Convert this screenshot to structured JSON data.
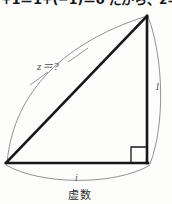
{
  "page": {
    "background_color": "#fdfdfc",
    "ink_color": "#17171a",
    "thin_line_color": "#7a7a80"
  },
  "top_text": {
    "clipped_line": "+1＝1+(−1)＝0 だから、z＝0 でも"
  },
  "diagram": {
    "hypotenuse_label": "z＝?",
    "vertical_side_label": "1",
    "base_side_label": "i",
    "base_caption": "虚数",
    "right_angle_marker": "right-angle-square",
    "vertices": {
      "bottom_left": [
        6,
        163
      ],
      "bottom_right": [
        148,
        163
      ],
      "apex": [
        148,
        15
      ]
    }
  }
}
